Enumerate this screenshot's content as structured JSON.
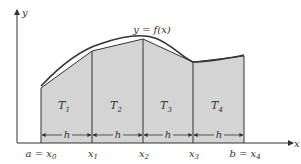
{
  "diagram": {
    "curve_label": "y = f(x)",
    "axis_x_label": "x",
    "axis_y_label": "y",
    "fill_color": "#d4d4d4",
    "line_color": "#333333",
    "trapezoids": [
      {
        "label": "T1",
        "main": "T",
        "sub": "1"
      },
      {
        "label": "T2",
        "main": "T",
        "sub": "2"
      },
      {
        "label": "T3",
        "main": "T",
        "sub": "3"
      },
      {
        "label": "T4",
        "main": "T",
        "sub": "4"
      }
    ],
    "width_label": "h",
    "x_ticks": [
      {
        "prefix": "a = ",
        "main": "x",
        "sub": "0"
      },
      {
        "prefix": "",
        "main": "x",
        "sub": "1"
      },
      {
        "prefix": "",
        "main": "x",
        "sub": "2"
      },
      {
        "prefix": "",
        "main": "x",
        "sub": "3"
      },
      {
        "prefix": "b = ",
        "main": "x",
        "sub": "4"
      }
    ]
  }
}
